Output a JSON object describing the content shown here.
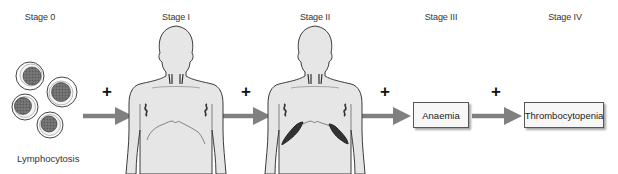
{
  "diagram": {
    "title": "",
    "stages": [
      {
        "id": "stage-0",
        "label": "Stage 0",
        "finding": "Lymphocytosis",
        "x": 40
      },
      {
        "id": "stage-1",
        "label": "Stage I",
        "finding": "Lymphadenopathy",
        "x": 176
      },
      {
        "id": "stage-2",
        "label": "Stage II",
        "finding": "Organomegaly",
        "x": 315
      },
      {
        "id": "stage-3",
        "label": "Stage III",
        "finding": "Anaemia",
        "x": 441
      },
      {
        "id": "stage-4",
        "label": "Stage IV",
        "finding": "Thrombocytopenia",
        "x": 565
      }
    ],
    "connector_symbol": "+",
    "boxes": {
      "anaemia": "Anaemia",
      "thrombocytopenia": "Thrombocytopenia"
    },
    "captions": {
      "lymphocytosis": "Lymphocytosis"
    },
    "colors": {
      "arrow": "#808080",
      "body_fill": "#e6e6e6",
      "body_stroke": "#3a3a3a",
      "organ": "#333333",
      "cell_nucleus": "#6a6a6a",
      "box_fill": "#f7f7f7"
    }
  }
}
